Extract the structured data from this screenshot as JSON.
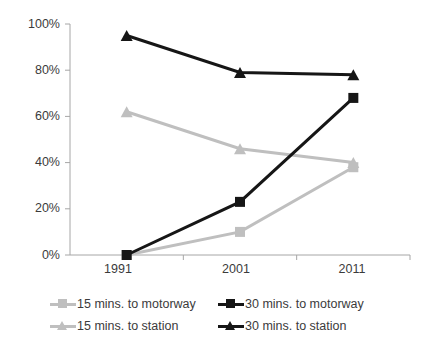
{
  "chart_data": {
    "type": "line",
    "title": "",
    "subtitle": "",
    "xlabel": "",
    "ylabel": "",
    "categories": [
      "1991",
      "2001",
      "2011"
    ],
    "x": [
      1991,
      2001,
      2011
    ],
    "ylim": [
      0,
      100
    ],
    "yticks": [
      0,
      20,
      40,
      60,
      80,
      100
    ],
    "ytick_labels": [
      "0%",
      "20%",
      "40%",
      "60%",
      "80%",
      "100%"
    ],
    "xtick_labels": [
      "1991",
      "2001",
      "2011"
    ],
    "grid": false,
    "legend_position": "bottom",
    "value_suffix": "%",
    "series": [
      {
        "name": "15 mins. to motorway",
        "marker": "square",
        "color": "#bfbfbf",
        "values": [
          0,
          10,
          38
        ]
      },
      {
        "name": "30 mins. to motorway",
        "marker": "square",
        "color": "#161616",
        "values": [
          0,
          23,
          68
        ]
      },
      {
        "name": "15 mins. to station",
        "marker": "triangle",
        "color": "#bfbfbf",
        "values": [
          62,
          46,
          40
        ]
      },
      {
        "name": "30 mins. to station",
        "marker": "triangle",
        "color": "#161616",
        "values": [
          95,
          79,
          78
        ]
      }
    ]
  },
  "legend": {
    "entries": [
      {
        "label": "15 mins. to motorway",
        "color": "#bfbfbf",
        "marker": "square"
      },
      {
        "label": "30 mins. to motorway",
        "color": "#161616",
        "marker": "square"
      },
      {
        "label": "15 mins. to station",
        "color": "#bfbfbf",
        "marker": "triangle"
      },
      {
        "label": "30 mins. to station",
        "color": "#161616",
        "marker": "triangle"
      }
    ]
  },
  "axis": {
    "y_labels": [
      "100%",
      "80%",
      "60%",
      "40%",
      "20%",
      "0%"
    ],
    "x_labels": [
      "1991",
      "2001",
      "2011"
    ]
  },
  "colors": {
    "light_gray": "#bfbfbf",
    "black": "#161616",
    "axis_gray": "#a6a6a6",
    "text_gray": "#3b3b3b",
    "background": "#ffffff"
  }
}
